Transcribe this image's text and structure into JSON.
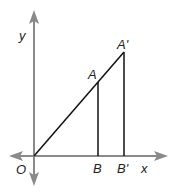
{
  "diagram": {
    "axes": {
      "x_label": "x",
      "y_label": "y",
      "origin_label": "O",
      "axis_color": "#8a8a8a"
    },
    "points": {
      "A": "A",
      "A_prime": "A'",
      "B": "B",
      "B_prime": "B'"
    },
    "line_color": "#111111"
  }
}
